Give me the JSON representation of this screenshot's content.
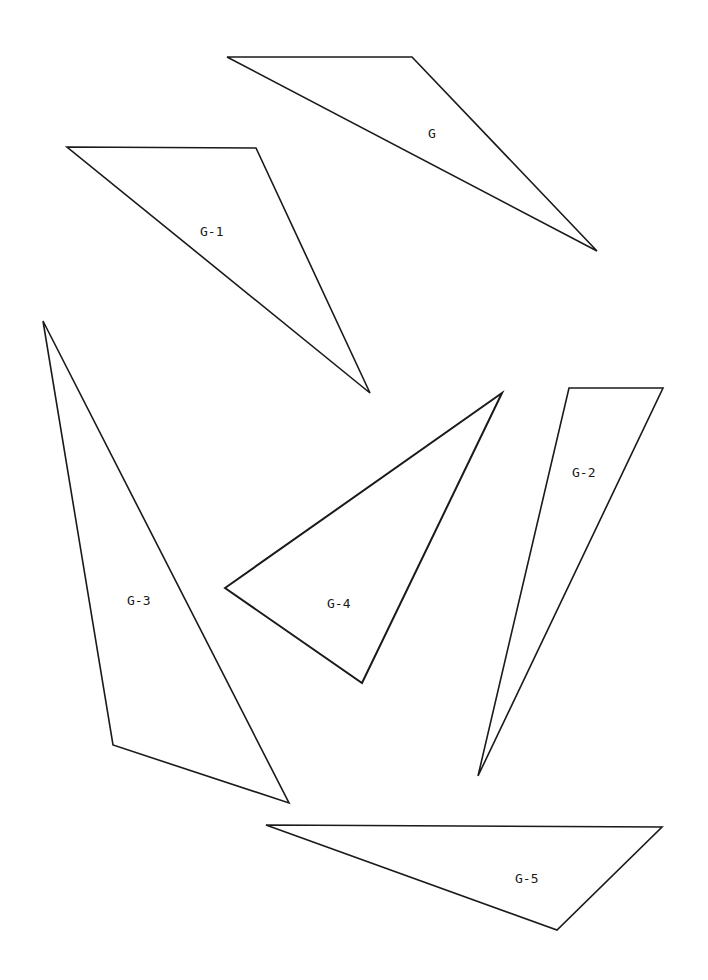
{
  "figure": {
    "width": 708,
    "height": 980,
    "background": "#ffffff",
    "stroke_color": "#1a1a1a",
    "shapes": [
      {
        "id": "G",
        "label": "G",
        "points": [
          [
            227,
            57
          ],
          [
            412,
            57
          ],
          [
            597,
            251
          ]
        ],
        "label_pos": [
          428,
          138
        ],
        "thick": false
      },
      {
        "id": "G-1",
        "label": "G-1",
        "points": [
          [
            67,
            147
          ],
          [
            256,
            148
          ],
          [
            370,
            393
          ]
        ],
        "label_pos": [
          200,
          236
        ],
        "thick": false
      },
      {
        "id": "G-3",
        "label": "G-3",
        "points": [
          [
            43,
            321
          ],
          [
            113,
            745
          ],
          [
            289,
            803
          ]
        ],
        "label_pos": [
          127,
          605
        ],
        "thick": false
      },
      {
        "id": "G-4",
        "label": "G-4",
        "points": [
          [
            225,
            588
          ],
          [
            502,
            393
          ],
          [
            362,
            683
          ]
        ],
        "label_pos": [
          327,
          608
        ],
        "thick": true
      },
      {
        "id": "G-2",
        "label": "G-2",
        "points": [
          [
            569,
            388
          ],
          [
            663,
            388
          ],
          [
            478,
            776
          ]
        ],
        "label_pos": [
          572,
          477
        ],
        "thick": false
      },
      {
        "id": "G-5",
        "label": "G-5",
        "points": [
          [
            266,
            825
          ],
          [
            662,
            827
          ],
          [
            557,
            930
          ]
        ],
        "label_pos": [
          515,
          883
        ],
        "thick": false
      }
    ]
  }
}
